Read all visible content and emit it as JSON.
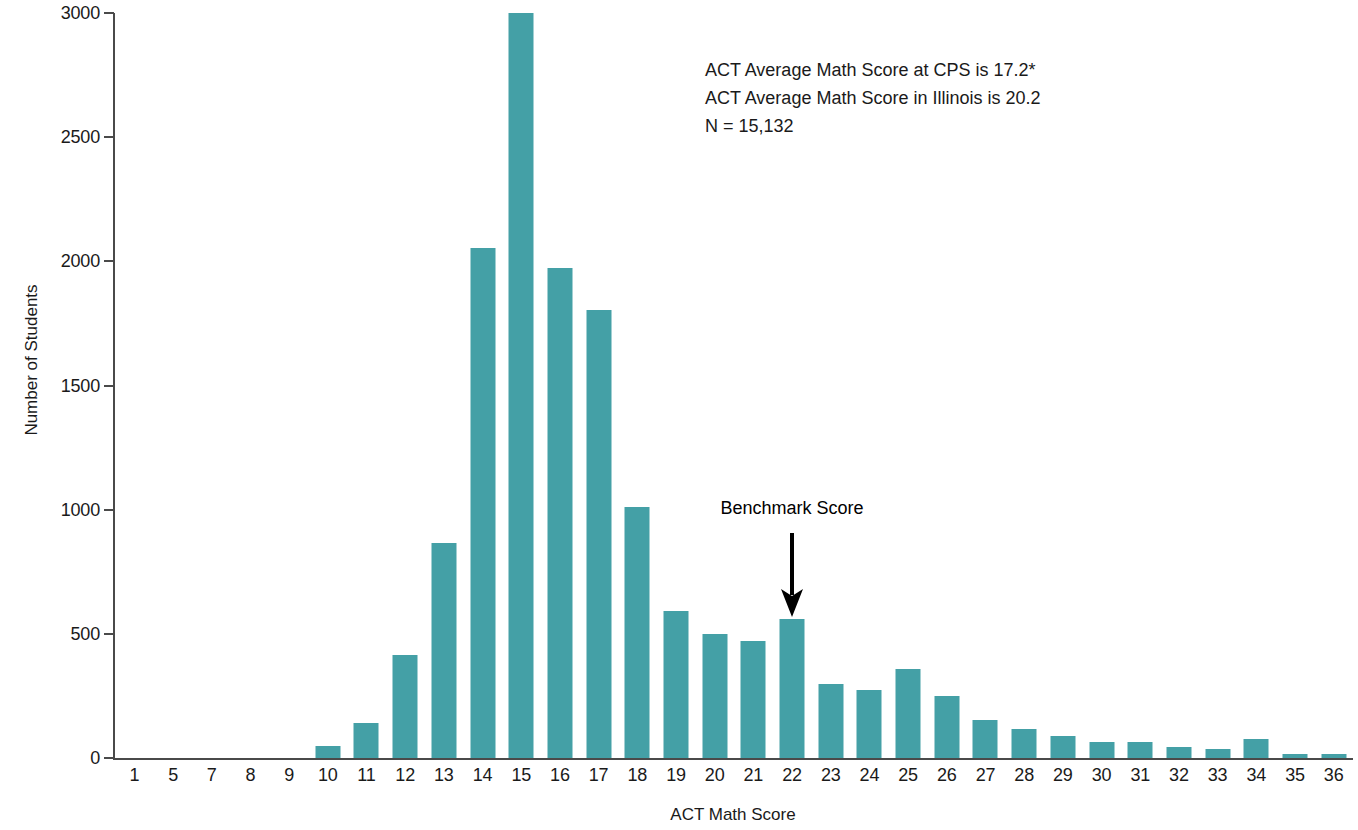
{
  "chart_data": {
    "type": "bar",
    "title": "",
    "xlabel": "ACT Math Score",
    "ylabel": "Number of Students",
    "ylim": [
      0,
      3000
    ],
    "ytick_values": [
      0,
      500,
      1000,
      1500,
      2000,
      2500,
      3000
    ],
    "ytick_labels": [
      "0",
      "500",
      "1000",
      "1500",
      "2000",
      "2500",
      "3000"
    ],
    "grid": false,
    "legend": "none",
    "bar_color": "#44a0a6",
    "axis_color": "#4a4a4a",
    "categories": [
      "1",
      "5",
      "7",
      "8",
      "9",
      "10",
      "11",
      "12",
      "13",
      "14",
      "15",
      "16",
      "17",
      "18",
      "19",
      "20",
      "21",
      "22",
      "23",
      "24",
      "25",
      "26",
      "27",
      "28",
      "29",
      "30",
      "31",
      "32",
      "33",
      "34",
      "35",
      "36"
    ],
    "values": [
      0,
      0,
      0,
      0,
      0,
      50,
      140,
      415,
      865,
      2055,
      3000,
      1975,
      1805,
      1010,
      590,
      500,
      470,
      560,
      300,
      275,
      360,
      250,
      155,
      115,
      90,
      65,
      65,
      45,
      35,
      75,
      18,
      15
    ],
    "annotations": [
      "ACT Average Math Score at CPS is 17.2*",
      "ACT Average Math Score in Illinois is 20.2",
      "N = 15,132"
    ],
    "benchmark": {
      "label": "Benchmark Score",
      "category": "22"
    }
  },
  "axes": {
    "y_title": "Number of Students",
    "x_title": "ACT Math Score"
  },
  "stats": {
    "line1": "ACT Average Math Score at CPS is 17.2*",
    "line2": "ACT Average Math Score in Illinois is 20.2",
    "line3": "N = 15,132"
  },
  "benchmark": {
    "label": "Benchmark Score"
  }
}
